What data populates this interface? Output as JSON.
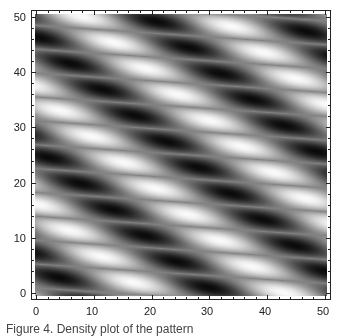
{
  "chart_data": {
    "type": "heatmap",
    "title": "",
    "xlabel": "",
    "ylabel": "",
    "xlim": [
      0,
      50
    ],
    "ylim": [
      0,
      50
    ],
    "x_ticks": [
      "0",
      "10",
      "20",
      "30",
      "40",
      "50"
    ],
    "y_ticks": [
      "0",
      "10",
      "20",
      "30",
      "40",
      "50"
    ],
    "colormap": "grayscale",
    "colors": {
      "low": "#000000",
      "high": "#ffffff",
      "frame": "#222222"
    },
    "pattern": {
      "description": "periodic lattice of alternating bright and dark elongated blobs forming bands tilted downward to the right",
      "lattice_a_px": [
        150,
        10
      ],
      "lattice_b_px": [
        32,
        26
      ],
      "origin_px": [
        24,
        96
      ]
    },
    "grid": false,
    "legend": null
  },
  "caption": "Figure 4. Density plot of the pattern"
}
